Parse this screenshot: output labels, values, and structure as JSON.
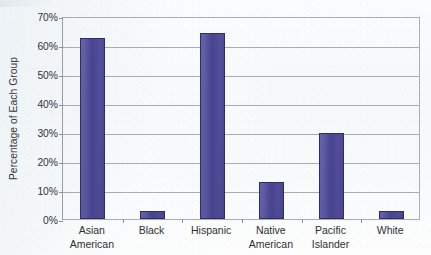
{
  "chart_data": {
    "type": "bar",
    "title": "",
    "xlabel": "",
    "ylabel": "Percentage of Each Group",
    "categories": [
      "Asian American",
      "Black",
      "Hispanic",
      "Native American",
      "Pacific Islander",
      "White"
    ],
    "category_lines": [
      [
        "Asian",
        "American"
      ],
      [
        "Black",
        ""
      ],
      [
        "Hispanic",
        ""
      ],
      [
        "Native",
        "American"
      ],
      [
        "Pacific",
        "Islander"
      ],
      [
        "White",
        ""
      ]
    ],
    "values": [
      62.5,
      2.8,
      64.0,
      12.8,
      29.7,
      2.8
    ],
    "value_unit": "%",
    "ylim": [
      0,
      70
    ],
    "ytick_step": 10,
    "ytick_labels": [
      "0%",
      "10%",
      "20%",
      "30%",
      "40%",
      "50%",
      "60%",
      "70%"
    ],
    "ytick_values": [
      0,
      10,
      20,
      30,
      40,
      50,
      60,
      70
    ],
    "grid": "horizontal",
    "legend": "none",
    "series": [
      {
        "name": "Percentage of Each Group",
        "values": [
          62.5,
          2.8,
          64.0,
          12.8,
          29.7,
          2.8
        ],
        "color": "#4B4796"
      }
    ],
    "colors": {
      "bar_fill": "#4B4796",
      "bar_outline": "#302C68",
      "gridline": "#A9ADB1",
      "axis_line": "#9A9EA2",
      "text": "#2E3033",
      "background": "#F7FAFB"
    }
  }
}
